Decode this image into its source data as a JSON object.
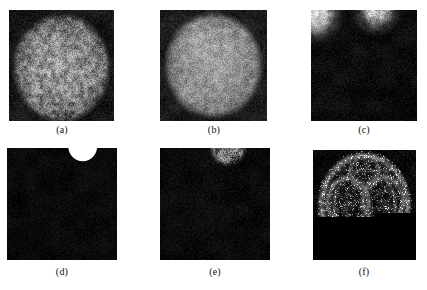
{
  "figure": {
    "kind": "multi-panel-grayscale-image-figure",
    "background_color": "#ffffff",
    "width": 427,
    "height": 290,
    "rows": 2,
    "columns": 3,
    "panels": [
      {
        "id": "a",
        "caption": "(a)",
        "x": 9,
        "y": 10,
        "width": 105,
        "height": 111,
        "caption_center_x": 62,
        "caption_y": 124,
        "render": {
          "type": "speckle-disk",
          "background_level": 22,
          "background_noise": 16,
          "disk_center_x": 0.5,
          "disk_center_y": 0.52,
          "disk_radius": 0.46,
          "disk_level": 150,
          "disk_noise": 62,
          "edge_softness": 0.1,
          "vignette": 0.35,
          "internal_texture": 0.55,
          "grain_scale": 1.3
        }
      },
      {
        "id": "b",
        "caption": "(b)",
        "x": 160,
        "y": 10,
        "width": 107,
        "height": 111,
        "caption_center_x": 214,
        "caption_y": 124,
        "render": {
          "type": "speckle-disk",
          "background_level": 26,
          "background_noise": 16,
          "disk_center_x": 0.5,
          "disk_center_y": 0.5,
          "disk_radius": 0.455,
          "disk_level": 164,
          "disk_noise": 48,
          "edge_softness": 0.13,
          "vignette": 0.3,
          "internal_texture": 0.4,
          "grain_scale": 1.6
        }
      },
      {
        "id": "c",
        "caption": "(c)",
        "x": 311,
        "y": 10,
        "width": 106,
        "height": 111,
        "caption_center_x": 364,
        "caption_y": 124,
        "render": {
          "type": "corner-blobs",
          "background_level": 12,
          "background_noise": 12,
          "blobs": [
            {
              "cx": 0.03,
              "cy": 0.02,
              "r": 0.2,
              "level": 215,
              "noise": 45,
              "soft": 0.55
            },
            {
              "cx": 0.62,
              "cy": -0.02,
              "r": 0.17,
              "level": 190,
              "noise": 55,
              "soft": 0.6
            }
          ],
          "grain_scale": 1.4
        }
      },
      {
        "id": "d",
        "caption": "(d)",
        "x": 7,
        "y": 148,
        "width": 110,
        "height": 112,
        "caption_center_x": 62,
        "caption_y": 266,
        "render": {
          "type": "white-notch",
          "background_level": 9,
          "background_noise": 9,
          "notch_center_x": 0.69,
          "notch_center_y": -0.02,
          "notch_radius": 0.135,
          "notch_level": 255,
          "notch_noise": 0,
          "grain_scale": 1.2
        }
      },
      {
        "id": "e",
        "caption": "(e)",
        "x": 160,
        "y": 148,
        "width": 110,
        "height": 112,
        "caption_center_x": 215,
        "caption_y": 266,
        "render": {
          "type": "speckle-blob",
          "background_level": 10,
          "background_noise": 10,
          "blobs": [
            {
              "cx": 0.62,
              "cy": -0.02,
              "r": 0.16,
              "level": 140,
              "noise": 70,
              "soft": 0.18
            }
          ],
          "grain_scale": 1.3
        }
      },
      {
        "id": "f",
        "caption": "(f)",
        "x": 313,
        "y": 150,
        "width": 103,
        "height": 110,
        "caption_center_x": 364,
        "caption_y": 266,
        "render": {
          "type": "edge-map",
          "background_level": 8,
          "background_noise": 13,
          "ring_center_x": 0.5,
          "ring_center_y": 0.5,
          "ring_radius": 0.42,
          "ring_thickness": 0.055,
          "ring_level": 135,
          "arcs": [
            {
              "cx": 0.34,
              "cy": 0.47,
              "r": 0.2,
              "thickness": 0.05,
              "level": 120
            },
            {
              "cx": 0.68,
              "cy": 0.46,
              "r": 0.2,
              "thickness": 0.05,
              "level": 120
            },
            {
              "cx": 0.5,
              "cy": 0.2,
              "r": 0.14,
              "thickness": 0.045,
              "level": 105
            },
            {
              "cx": 0.5,
              "cy": 0.78,
              "r": 0.15,
              "thickness": 0.045,
              "level": 105
            },
            {
              "cx": 0.5,
              "cy": 0.5,
              "r": 0.3,
              "thickness": 0.04,
              "level": 90
            }
          ],
          "sparkle_density": 0.16,
          "grain_scale": 1.1
        }
      }
    ]
  }
}
